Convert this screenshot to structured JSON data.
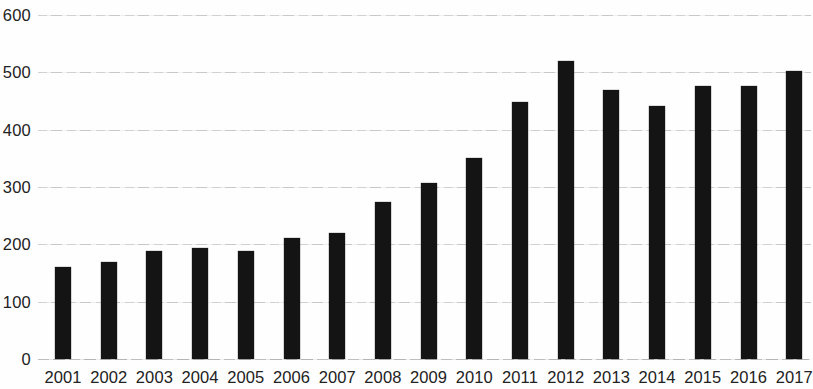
{
  "chart_data": {
    "type": "bar",
    "title": "",
    "subtitle": "",
    "xlabel": "",
    "ylabel": "",
    "categories": [
      "2001",
      "2002",
      "2003",
      "2004",
      "2005",
      "2006",
      "2007",
      "2008",
      "2009",
      "2010",
      "2011",
      "2012",
      "2013",
      "2014",
      "2015",
      "2016",
      "2017"
    ],
    "values": [
      160,
      170,
      189,
      194,
      188,
      211,
      220,
      274,
      307,
      350,
      449,
      520,
      470,
      441,
      477,
      477,
      502
    ],
    "series": [
      {
        "name": "",
        "values": [
          160,
          170,
          189,
          194,
          188,
          211,
          220,
          274,
          307,
          350,
          449,
          520,
          470,
          441,
          477,
          477,
          502
        ]
      }
    ],
    "ylim": [
      0,
      600
    ],
    "y_ticks": [
      0,
      100,
      200,
      300,
      400,
      500,
      600
    ],
    "y_tick_labels": [
      "0",
      "100",
      "200",
      "300",
      "400",
      "500",
      "600"
    ],
    "grid": true,
    "grid_axis": "y",
    "legend": false,
    "legend_position": "none",
    "bar_color": "#141414",
    "grid_color": "#c9c9c9",
    "background_color": "#ffffff",
    "text_color": "#222222"
  }
}
